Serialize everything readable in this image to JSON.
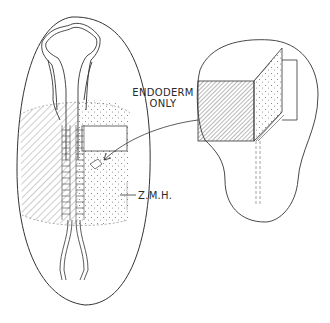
{
  "diagram": {
    "labels": {
      "endoderm_line1": "ENDODERM",
      "endoderm_line2": "ONLY",
      "zmh": "Z.M.H."
    },
    "parts": {
      "left": "embryo-dorsal-view",
      "right": "excised-explant-view"
    },
    "colors": {
      "stroke": "#333333",
      "background": "#ffffff"
    }
  }
}
